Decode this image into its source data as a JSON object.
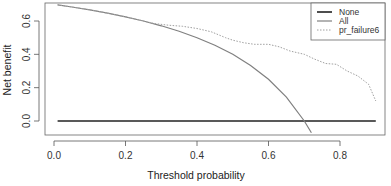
{
  "chart_data": {
    "type": "line",
    "title": "",
    "xlabel": "Threshold probability",
    "ylabel": "Net benefit",
    "xlim": [
      -0.02,
      0.92
    ],
    "ylim": [
      -0.08,
      0.71
    ],
    "xticks": [
      0.0,
      0.2,
      0.4,
      0.6,
      0.8
    ],
    "xtick_labels": [
      "0.0",
      "0.2",
      "0.4",
      "0.6",
      "0.8"
    ],
    "yticks": [
      0.0,
      0.2,
      0.4,
      0.6
    ],
    "ytick_labels": [
      "0.0",
      "0.2",
      "0.4",
      "0.6"
    ],
    "grid": false,
    "legend_position": "top-right",
    "series": [
      {
        "name": "None",
        "style": "solid",
        "color": "#222222",
        "width": 1.6,
        "x": [
          0.01,
          0.9
        ],
        "y": [
          0.0,
          0.0
        ]
      },
      {
        "name": "All",
        "style": "solid",
        "color": "#808080",
        "width": 1.2,
        "x": [
          0.01,
          0.05,
          0.1,
          0.15,
          0.2,
          0.25,
          0.3,
          0.35,
          0.4,
          0.45,
          0.5,
          0.55,
          0.6,
          0.65,
          0.7,
          0.72
        ],
        "y": [
          0.697,
          0.684,
          0.667,
          0.647,
          0.625,
          0.6,
          0.571,
          0.538,
          0.5,
          0.455,
          0.4,
          0.333,
          0.25,
          0.143,
          0.0,
          -0.071
        ]
      },
      {
        "name": "pr_failure6",
        "style": "dotted",
        "color": "#a0a0a0",
        "width": 1.0,
        "x": [
          0.01,
          0.05,
          0.1,
          0.15,
          0.2,
          0.25,
          0.28,
          0.32,
          0.36,
          0.4,
          0.44,
          0.48,
          0.5,
          0.53,
          0.56,
          0.6,
          0.63,
          0.66,
          0.7,
          0.73,
          0.76,
          0.79,
          0.82,
          0.85,
          0.88,
          0.9
        ],
        "y": [
          0.697,
          0.684,
          0.667,
          0.647,
          0.625,
          0.6,
          0.585,
          0.575,
          0.568,
          0.555,
          0.535,
          0.5,
          0.485,
          0.47,
          0.46,
          0.46,
          0.445,
          0.42,
          0.4,
          0.37,
          0.345,
          0.34,
          0.3,
          0.27,
          0.22,
          0.12
        ]
      }
    ]
  },
  "legend": {
    "items": [
      {
        "label": "None",
        "style": "solid",
        "color": "#222222"
      },
      {
        "label": "All",
        "style": "solid",
        "color": "#808080"
      },
      {
        "label": "pr_failure6",
        "style": "dotted",
        "color": "#a0a0a0"
      }
    ]
  },
  "colors": {
    "axis": "#555555",
    "frame": "#666666",
    "background": "#ffffff"
  }
}
